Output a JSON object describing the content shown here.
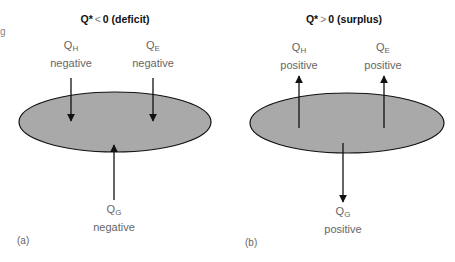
{
  "edge_fragment": "g",
  "panels": [
    {
      "id": "a",
      "panel_label": "(a)",
      "title": {
        "lhs": "Q*",
        "relation": "<",
        "rhs": "0 (deficit)"
      },
      "fluxes": {
        "QH": {
          "symbol": "Q",
          "subscript": "H",
          "sign": "negative",
          "direction": "down-into-surface"
        },
        "QE": {
          "symbol": "Q",
          "subscript": "E",
          "sign": "negative",
          "direction": "down-into-surface"
        },
        "QG": {
          "symbol": "Q",
          "subscript": "G",
          "sign": "negative",
          "direction": "up-into-surface"
        }
      }
    },
    {
      "id": "b",
      "panel_label": "(b)",
      "title": {
        "lhs": "Q*",
        "relation": ">",
        "rhs": "0 (surplus)"
      },
      "fluxes": {
        "QH": {
          "symbol": "Q",
          "subscript": "H",
          "sign": "positive",
          "direction": "up-away-from-surface"
        },
        "QE": {
          "symbol": "Q",
          "subscript": "E",
          "sign": "positive",
          "direction": "up-away-from-surface"
        },
        "QG": {
          "symbol": "Q",
          "subscript": "G",
          "sign": "positive",
          "direction": "down-away-from-surface"
        }
      }
    }
  ],
  "colors": {
    "surface_fill": "#a9a9a9",
    "surface_stroke": "#111111",
    "arrow": "#111111",
    "label_text": "#666666"
  }
}
